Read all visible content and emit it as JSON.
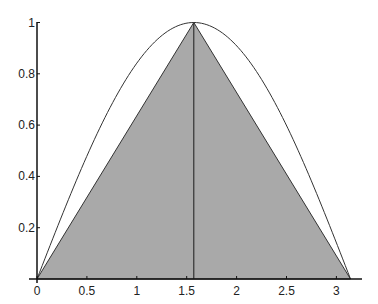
{
  "chart_data": {
    "type": "area",
    "title": "",
    "xlabel": "",
    "ylabel": "",
    "xlim": [
      0,
      3.25
    ],
    "ylim": [
      0,
      1
    ],
    "grid": false,
    "legend": null,
    "x_ticks": [
      "0",
      "0.5",
      "1",
      "1.5",
      "2",
      "2.5",
      "3"
    ],
    "y_ticks": [
      "0.2",
      "0.4",
      "0.6",
      "0.8",
      "1"
    ],
    "series": [
      {
        "name": "sin(x)",
        "type": "line",
        "x": [
          0,
          0.3927,
          0.7854,
          1.1781,
          1.5708,
          1.9635,
          2.3562,
          2.7489,
          3.1416
        ],
        "y": [
          0,
          0.3827,
          0.7071,
          0.9239,
          1.0,
          0.9239,
          0.7071,
          0.3827,
          0
        ],
        "color": "#333333"
      },
      {
        "name": "triangle",
        "type": "area",
        "x": [
          0,
          1.5708,
          3.1416
        ],
        "y": [
          0,
          1,
          0
        ],
        "fill": "#a9a9a9",
        "color": "#333333"
      },
      {
        "name": "vertical-line",
        "type": "line",
        "x": [
          1.5708,
          1.5708
        ],
        "y": [
          0,
          1
        ],
        "color": "#333333"
      }
    ],
    "annotations": []
  },
  "axis": {
    "x_labels": [
      "0",
      "0.5",
      "1",
      "1.5",
      "2",
      "2.5",
      "3"
    ],
    "y_labels": [
      "0.2",
      "0.4",
      "0.6",
      "0.8",
      "1"
    ]
  }
}
